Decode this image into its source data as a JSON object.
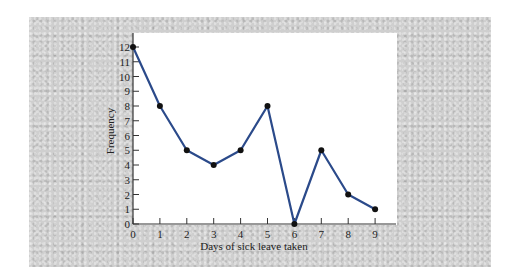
{
  "chart_data": {
    "type": "line",
    "title": "",
    "xlabel": "Days of sick leave taken",
    "ylabel": "Frequency",
    "x": [
      0,
      1,
      2,
      3,
      4,
      5,
      6,
      7,
      8,
      9
    ],
    "categories": [
      "0",
      "1",
      "2",
      "3",
      "4",
      "5",
      "6",
      "7",
      "8",
      "9"
    ],
    "series": [
      {
        "name": "Frequency",
        "values": [
          12,
          8,
          5,
          4,
          5,
          8,
          0,
          5,
          2,
          1
        ]
      }
    ],
    "xlim": [
      0,
      9
    ],
    "ylim": [
      0,
      12
    ],
    "yticks": [
      "0",
      "1",
      "2",
      "3",
      "4",
      "5",
      "6",
      "7",
      "8",
      "9",
      "10",
      "11",
      "12"
    ],
    "xticks": [
      "0",
      "1",
      "2",
      "3",
      "4",
      "5",
      "6",
      "7",
      "8",
      "9"
    ],
    "grid": false,
    "legend": null,
    "line_color": "#2b4a8a",
    "marker_color": "#111111"
  }
}
